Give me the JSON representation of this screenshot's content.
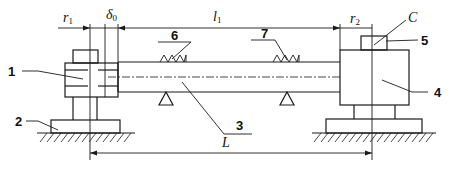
{
  "diagram": {
    "type": "mechanical schematic",
    "dimensions": {
      "r1": {
        "symbol": "r",
        "subscript": "1"
      },
      "delta0": {
        "symbol": "δ",
        "subscript": "0"
      },
      "l1": {
        "symbol": "l",
        "subscript": "1"
      },
      "r2": {
        "symbol": "r",
        "subscript": "2"
      },
      "L": {
        "symbol": "L"
      }
    },
    "point_labels": {
      "C": "C"
    },
    "part_numbers": {
      "p1": "1",
      "p2": "2",
      "p3": "3",
      "p4": "4",
      "p5": "5",
      "p6": "6",
      "p7": "7"
    },
    "colors": {
      "line": "#1a1a1a",
      "background": "#ffffff"
    }
  }
}
